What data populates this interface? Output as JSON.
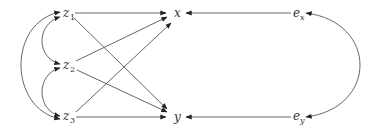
{
  "diagram": {
    "type": "path-diagram",
    "nodes": {
      "z1": {
        "base": "z",
        "sub": "1",
        "x": 69,
        "y": 14
      },
      "z2": {
        "base": "z",
        "sub": "2",
        "x": 69,
        "y": 66
      },
      "z3": {
        "base": "z",
        "sub": "3",
        "x": 69,
        "y": 117
      },
      "x": {
        "base": "x",
        "sub": "",
        "x": 178,
        "y": 13
      },
      "y": {
        "base": "y",
        "sub": "",
        "x": 178,
        "y": 117
      },
      "ex": {
        "base": "e",
        "sub": "x",
        "x": 297,
        "y": 14
      },
      "ey": {
        "base": "e",
        "sub": "y",
        "x": 297,
        "y": 117
      }
    },
    "directed_edges": [
      [
        "z1",
        "x"
      ],
      [
        "z1",
        "y"
      ],
      [
        "z2",
        "x"
      ],
      [
        "z2",
        "y"
      ],
      [
        "z3",
        "x"
      ],
      [
        "z3",
        "y"
      ],
      [
        "ex",
        "x"
      ],
      [
        "ey",
        "y"
      ]
    ],
    "bidirected_edges": [
      [
        "z1",
        "z2"
      ],
      [
        "z2",
        "z3"
      ],
      [
        "z1",
        "z3"
      ],
      [
        "ex",
        "ey"
      ]
    ]
  }
}
